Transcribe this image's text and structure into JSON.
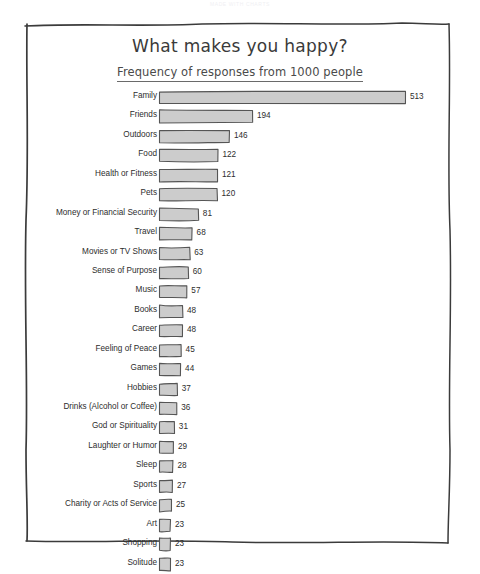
{
  "watermark": "MADE WITH CHARTS",
  "chart_data": {
    "type": "bar",
    "orientation": "horizontal",
    "title": "What makes you happy?",
    "subtitle": "Frequency of responses from 1000 people",
    "xlabel": "",
    "ylabel": "",
    "xlim": [
      0,
      513
    ],
    "grid": false,
    "legend": false,
    "style": "hand-drawn sketch",
    "bar_color": "#cccccc",
    "bar_outline_color": "#555555",
    "text_color": "#2d2d2d",
    "categories": [
      "Family",
      "Friends",
      "Outdoors",
      "Food",
      "Health or Fitness",
      "Pets",
      "Money or Financial Security",
      "Travel",
      "Movies or TV Shows",
      "Sense of Purpose",
      "Music",
      "Books",
      "Career",
      "Feeling of Peace",
      "Games",
      "Hobbies",
      "Drinks (Alcohol or Coffee)",
      "God or Spirituality",
      "Laughter or Humor",
      "Sleep",
      "Sports",
      "Charity or Acts of Service",
      "Art",
      "Shopping",
      "Solitude"
    ],
    "values": [
      513,
      194,
      146,
      122,
      121,
      120,
      81,
      68,
      63,
      60,
      57,
      48,
      48,
      45,
      44,
      37,
      36,
      31,
      29,
      28,
      27,
      25,
      23,
      23,
      23
    ],
    "value_labels": [
      "513",
      "194",
      "146",
      "122",
      "121",
      "120",
      "81",
      "68",
      "63",
      "60",
      "57",
      "48",
      "48",
      "45",
      "44",
      "37",
      "36",
      "31",
      "29",
      "28",
      "27",
      "25",
      "23",
      "23",
      "23"
    ]
  }
}
